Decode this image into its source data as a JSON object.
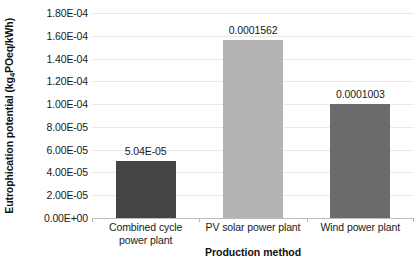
{
  "chart_data": {
    "type": "bar",
    "title": "",
    "xlabel": "Production method",
    "ylabel": "Eutrophication potential (kg",
    "ylabel_sub": "4",
    "ylabel_tail": "POeq/kWh)",
    "ylabel_full": "Eutrophication potential (kg4POeq/kWh)",
    "categories": [
      "Combined cycle power plant",
      "PV solar power plant",
      "Wind power plant"
    ],
    "category_lines": [
      [
        "Combined cycle",
        "power plant"
      ],
      [
        "PV solar power plant"
      ],
      [
        "Wind power plant"
      ]
    ],
    "values": [
      5.04e-05,
      0.0001562,
      0.0001003
    ],
    "data_labels": [
      "5.04E-05",
      "0.0001562",
      "0.0001003"
    ],
    "bar_colors": [
      "#454545",
      "#b3b3b3",
      "#6b6b6b"
    ],
    "ylim": [
      0,
      0.00018
    ],
    "ytick_values": [
      0.00018,
      0.00016,
      0.00014,
      0.00012,
      0.0001,
      8e-05,
      6e-05,
      4e-05,
      2e-05,
      0
    ],
    "ytick_labels": [
      "1.80E-04",
      "1.60E-04",
      "1.40E-04",
      "1.20E-04",
      "1.00E-04",
      "8.00E-05",
      "6.00E-05",
      "4.00E-05",
      "2.00E-05",
      "0.00E+00"
    ],
    "grid": true,
    "grid_color": "#e9e9e9",
    "legend": "none",
    "background": "#ffffff"
  }
}
